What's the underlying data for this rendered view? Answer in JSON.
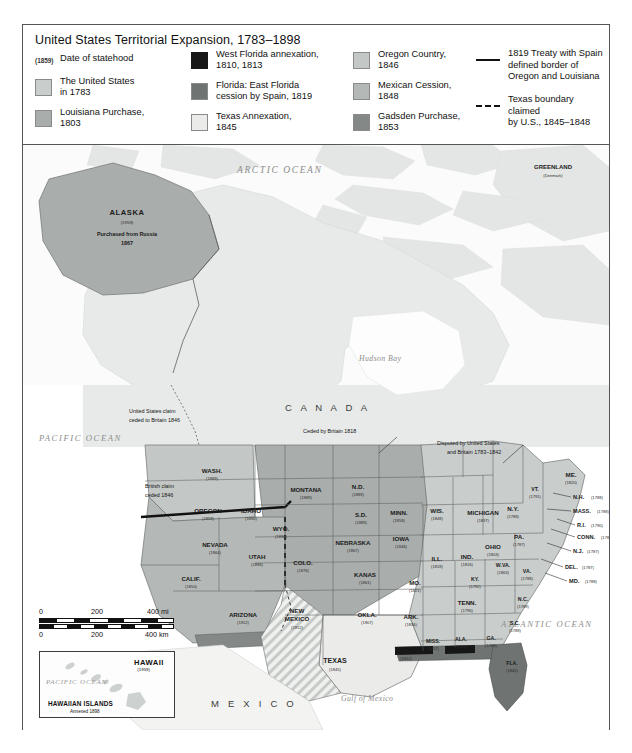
{
  "legend": {
    "title": "United States Territorial Expansion, 1783–1898",
    "date_key": {
      "sample": "(1859)",
      "label": "Date of statehood"
    },
    "column1": [
      {
        "swatch": "#c9cdcc",
        "label": "The United States\nin 1783"
      },
      {
        "swatch": "#a9adac",
        "label": "Louisiana Purchase,\n1803"
      }
    ],
    "column2": [
      {
        "swatch": "#171717",
        "label": "West Florida annexation,\n1810, 1813"
      },
      {
        "swatch": "#6f7372",
        "label": "Florida: East Florida\ncession by Spain, 1819"
      },
      {
        "swatch": "#ebecea",
        "label": "Texas Annexation,\n1845"
      }
    ],
    "column3": [
      {
        "swatch": "#c3c7c5",
        "label": "Oregon Country,\n1846"
      },
      {
        "swatch": "#b4b8b6",
        "label": "Mexican Cession,\n1848"
      },
      {
        "swatch": "#848887",
        "label": "Gadsden Purchase,\n1853"
      }
    ],
    "column4": [
      {
        "style": "solid-line",
        "label": "1819 Treaty with Spain\ndefined border of\nOregon and Louisiana"
      },
      {
        "style": "dashed-line",
        "label": "Texas boundary claimed\nby U.S., 1845–1848"
      }
    ]
  },
  "map": {
    "oceans": [
      {
        "name": "ARCTIC OCEAN",
        "x": 236,
        "y": 24,
        "size": 9.5
      },
      {
        "name": "PACIFIC OCEAN",
        "x": 18,
        "y": 293,
        "size": 8.6
      },
      {
        "name": "ATLANTIC OCEAN",
        "x": 478,
        "y": 480,
        "size": 8.6
      },
      {
        "name": "Hudson Bay",
        "x": 360,
        "y": 212,
        "size": 7.6
      },
      {
        "name": "Gulf of Mexico",
        "x": 345,
        "y": 552,
        "size": 7.6
      }
    ],
    "countries": [
      {
        "name": "C A N A D A",
        "x": 287,
        "y": 261
      },
      {
        "name": "M E X I C O",
        "x": 216,
        "y": 559
      }
    ],
    "places": [
      {
        "name": "GREENLAND",
        "sub": "(Denmark)",
        "x": 528,
        "y": 170
      },
      {
        "name": "CUBA",
        "x": 455,
        "y": 710
      },
      {
        "name": "PUERTO RICO",
        "sub": "(1898)",
        "x": 560,
        "y": 690
      },
      {
        "name": "BAHAMAS",
        "x": 520,
        "y": 650
      }
    ],
    "alaska": {
      "name": "ALASKA",
      "date": "(1959)",
      "note1": "Purchased from Russia",
      "note2": "1867"
    },
    "annotations": [
      {
        "text": "United States claim\nceded to Britain 1846",
        "x": 126,
        "y": 272
      },
      {
        "text": "Ceded by Britain 1818",
        "x": 312,
        "y": 283
      },
      {
        "text": "Disputed by United States\nand Britain 1783–1842",
        "x": 448,
        "y": 305
      },
      {
        "text": "British claim\nceded 1846",
        "x": 140,
        "y": 346
      },
      {
        "text": "Annexed 1810",
        "x": 368,
        "y": 669
      },
      {
        "text": "Annexed 1813",
        "x": 418,
        "y": 655
      }
    ],
    "states": [
      {
        "abbr": "WASH.",
        "date": "(1889)",
        "x": 189,
        "y": 329
      },
      {
        "abbr": "OREGON",
        "date": "(1859)",
        "x": 185,
        "y": 372
      },
      {
        "abbr": "IDAHO",
        "date": "(1890)",
        "x": 228,
        "y": 374
      },
      {
        "abbr": "MONTANA",
        "date": "(1889)",
        "x": 283,
        "y": 343
      },
      {
        "abbr": "WYO.",
        "date": "(1890)",
        "x": 258,
        "y": 360
      },
      {
        "abbr": "N.D.",
        "date": "(1889)",
        "x": 335,
        "y": 338
      },
      {
        "abbr": "S.D.",
        "date": "(1889)",
        "x": 340,
        "y": 368
      },
      {
        "abbr": "MINN.",
        "date": "(1858)",
        "x": 378,
        "y": 365
      },
      {
        "abbr": "WIS.",
        "date": "(1848)",
        "x": 415,
        "y": 363
      },
      {
        "abbr": "MICHIGAN",
        "date": "(1837)",
        "x": 458,
        "y": 370
      },
      {
        "abbr": "NEVADA",
        "date": "(1864)",
        "x": 194,
        "y": 400
      },
      {
        "abbr": "UTAH",
        "date": "(1896)",
        "x": 234,
        "y": 413
      },
      {
        "abbr": "COLO.",
        "date": "(1876)",
        "x": 281,
        "y": 417
      },
      {
        "abbr": "NEBRASKA",
        "date": "(1867)",
        "x": 331,
        "y": 397
      },
      {
        "abbr": "IOWA",
        "date": "(1846)",
        "x": 379,
        "y": 392
      },
      {
        "abbr": "ILL.",
        "date": "(1818)",
        "x": 415,
        "y": 412
      },
      {
        "abbr": "IND.",
        "date": "(1816)",
        "x": 443,
        "y": 410
      },
      {
        "abbr": "OHIO",
        "date": "(1803)",
        "x": 468,
        "y": 400
      },
      {
        "abbr": "CALIF.",
        "date": "(1850)",
        "x": 170,
        "y": 434
      },
      {
        "abbr": "ARIZONA",
        "date": "(1912)",
        "x": 221,
        "y": 470
      },
      {
        "abbr": "NEW\nMEXICO",
        "date": "(1912)",
        "x": 275,
        "y": 472
      },
      {
        "abbr": "KANAS",
        "date": "(1861)",
        "x": 344,
        "y": 428
      },
      {
        "abbr": "MO.",
        "date": "(1821)",
        "x": 392,
        "y": 437
      },
      {
        "abbr": "KY.",
        "date": "(1792)",
        "x": 452,
        "y": 432
      },
      {
        "abbr": "W.VA.",
        "date": "(1863)",
        "x": 480,
        "y": 419
      },
      {
        "abbr": "VA.",
        "date": "(1788)",
        "x": 504,
        "y": 424
      },
      {
        "abbr": "PA.",
        "date": "(1787)",
        "x": 497,
        "y": 391
      },
      {
        "abbr": "N.Y.",
        "date": "(1788)",
        "x": 490,
        "y": 362
      },
      {
        "abbr": "VT.",
        "date": "(1791)",
        "x": 513,
        "y": 343
      },
      {
        "abbr": "ME.",
        "date": "(1820)",
        "x": 548,
        "y": 330
      },
      {
        "abbr": "OKLA.",
        "date": "(1907)",
        "x": 345,
        "y": 468
      },
      {
        "abbr": "ARK.",
        "date": "(1836)",
        "x": 390,
        "y": 471
      },
      {
        "abbr": "TENN.",
        "date": "(1796)",
        "x": 444,
        "y": 457
      },
      {
        "abbr": "N.C.",
        "date": "(1789)",
        "x": 500,
        "y": 454
      },
      {
        "abbr": "S.C.",
        "date": "(1788)",
        "x": 492,
        "y": 477
      },
      {
        "abbr": "MISS.",
        "date": "(1817)",
        "x": 410,
        "y": 496
      },
      {
        "abbr": "ALA.",
        "date": "(1819)",
        "x": 438,
        "y": 494
      },
      {
        "abbr": "GA.",
        "date": "(1788)",
        "x": 468,
        "y": 493
      },
      {
        "abbr": "LA.",
        "date": "(1812)",
        "x": 385,
        "y": 505
      },
      {
        "abbr": "TEXAS",
        "date": "(1845)",
        "x": 313,
        "y": 516
      },
      {
        "abbr": "FLA.",
        "date": "(1845)",
        "x": 489,
        "y": 518
      }
    ],
    "states_inline": [
      {
        "abbr": "N.H.",
        "date": "(1788)",
        "x": 536,
        "y": 352
      },
      {
        "abbr": "MASS.",
        "date": "(1788)",
        "x": 533,
        "y": 367
      },
      {
        "abbr": "R.I.",
        "date": "(1790)",
        "x": 540,
        "y": 381
      },
      {
        "abbr": "CONN.",
        "date": "(1788)",
        "x": 534,
        "y": 393
      },
      {
        "abbr": "N.J.",
        "date": "(1787)",
        "x": 530,
        "y": 408
      },
      {
        "abbr": "DEL.",
        "date": "(1787)",
        "x": 524,
        "y": 424
      },
      {
        "abbr": "MD.",
        "date": "(1788)",
        "x": 528,
        "y": 438
      }
    ]
  },
  "scale": {
    "miles": {
      "start": "0",
      "mid": "200",
      "end": "400 mi"
    },
    "km": {
      "start": "0",
      "mid": "200",
      "end": "400 km"
    }
  },
  "hawaii_inset": {
    "title": "HAWAII",
    "date": "(1959)",
    "ocean": "PACIFIC\nOCEAN",
    "footer": "HAWAIIAN ISLANDS",
    "footer_sub": "Annexed 1898"
  }
}
